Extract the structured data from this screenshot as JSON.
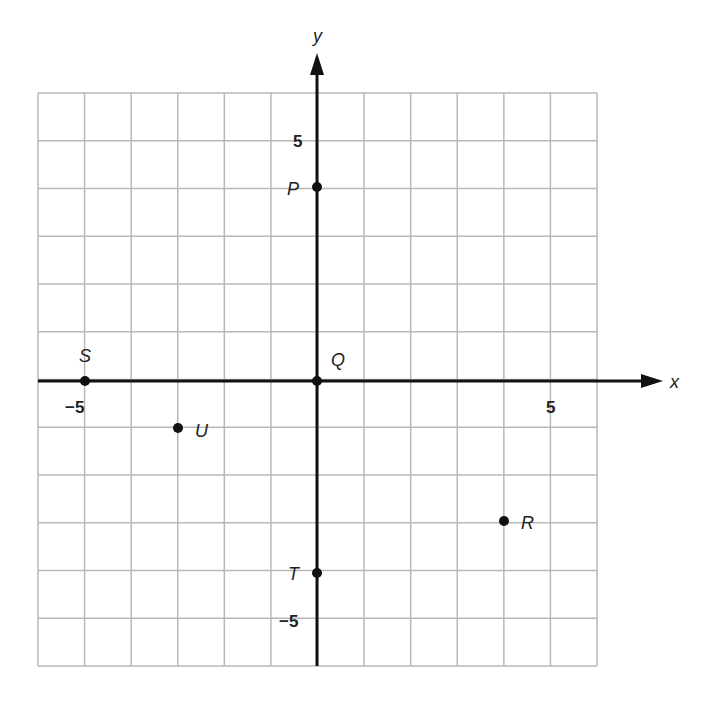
{
  "chart_data": {
    "type": "scatter",
    "title": "",
    "xlabel": "x",
    "ylabel": "y",
    "xlim": [
      -6,
      6
    ],
    "ylim": [
      -6,
      6
    ],
    "grid": true,
    "tick_labels": {
      "x": [
        {
          "value": -5,
          "label": "−5"
        },
        {
          "value": 5,
          "label": "5"
        }
      ],
      "y": [
        {
          "value": 5,
          "label": "5"
        },
        {
          "value": -5,
          "label": "−5"
        }
      ]
    },
    "points": [
      {
        "label": "P",
        "x": 0,
        "y": 4
      },
      {
        "label": "Q",
        "x": 0,
        "y": 0
      },
      {
        "label": "S",
        "x": -5,
        "y": 0
      },
      {
        "label": "U",
        "x": -3,
        "y": -1
      },
      {
        "label": "R",
        "x": 4,
        "y": -3
      },
      {
        "label": "T",
        "x": 0,
        "y": -4
      }
    ]
  },
  "axes": {
    "x_label": "x",
    "y_label": "y"
  },
  "colors": {
    "grid": "#b8b8b8",
    "axis": "#111111",
    "point": "#111111",
    "text": "#222222"
  }
}
